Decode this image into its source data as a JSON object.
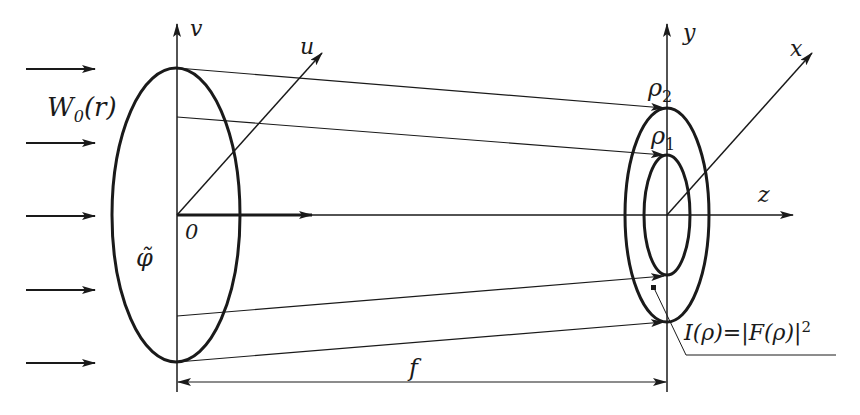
{
  "diagram": {
    "type": "optical-schematic",
    "colors": {
      "stroke": "#1a1a1a",
      "background": "#ffffff"
    },
    "input_plane": {
      "axis_v": "v",
      "axis_u": "u",
      "origin": "0",
      "phase_label": "φ̃",
      "beam_label_main": "W",
      "beam_label_sub": "0",
      "beam_label_arg": "(r)"
    },
    "output_plane": {
      "axis_y": "y",
      "axis_x": "x",
      "axis_z": "z",
      "rho_outer_main": "ρ",
      "rho_outer_sub": "2",
      "rho_inner_main": "ρ",
      "rho_inner_sub": "1",
      "intensity_label_main": "I(ρ)=|F(ρ)|",
      "intensity_label_sup": "2"
    },
    "focal_length_label": "f",
    "input_arrow_count": 5
  }
}
